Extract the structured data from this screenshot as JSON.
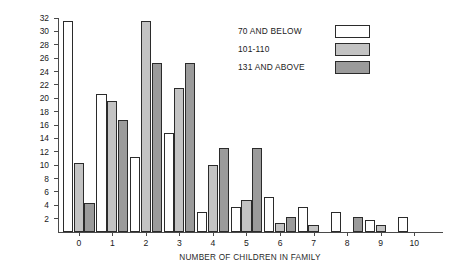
{
  "chart_data": {
    "type": "bar",
    "title": "",
    "xlabel": "NUMBER OF CHILDREN IN FAMILY",
    "ylabel": "PERCENT OF PARENTS IN POPULATION",
    "categories": [
      "0",
      "1",
      "2",
      "3",
      "4",
      "5",
      "6",
      "7",
      "8",
      "9",
      "10"
    ],
    "ylim": [
      0,
      32
    ],
    "ytick_labels": [
      "2",
      "4",
      "6",
      "8",
      "10",
      "12",
      "14",
      "16",
      "18",
      "20",
      "22",
      "24",
      "26",
      "28",
      "30",
      "32"
    ],
    "ytick_values": [
      2,
      4,
      6,
      8,
      10,
      12,
      14,
      16,
      18,
      20,
      22,
      24,
      26,
      28,
      30,
      32
    ],
    "grid": false,
    "legend_position": "top-right",
    "series": [
      {
        "name": "70 AND BELOW",
        "color": "#ffffff",
        "values": [
          31.5,
          20.7,
          11.2,
          14.8,
          3.0,
          3.7,
          5.2,
          3.8,
          3.0,
          1.8,
          2.2
        ]
      },
      {
        "name": "101-110",
        "color": "#c3c3c3",
        "values": [
          10.3,
          19.6,
          31.5,
          21.5,
          10.0,
          4.8,
          1.4,
          1.0,
          0,
          1.0,
          0
        ]
      },
      {
        "name": "131 AND ABOVE",
        "color": "#9b9b9b",
        "values": [
          4.3,
          16.8,
          25.3,
          25.3,
          12.5,
          12.5,
          2.2,
          0,
          2.2,
          0,
          0
        ]
      }
    ]
  },
  "legend": {
    "items": [
      {
        "label": "70 AND BELOW",
        "swatch": "white"
      },
      {
        "label": "101-110",
        "swatch": "light-gray"
      },
      {
        "label": "131 AND ABOVE",
        "swatch": "dark-gray"
      }
    ]
  }
}
